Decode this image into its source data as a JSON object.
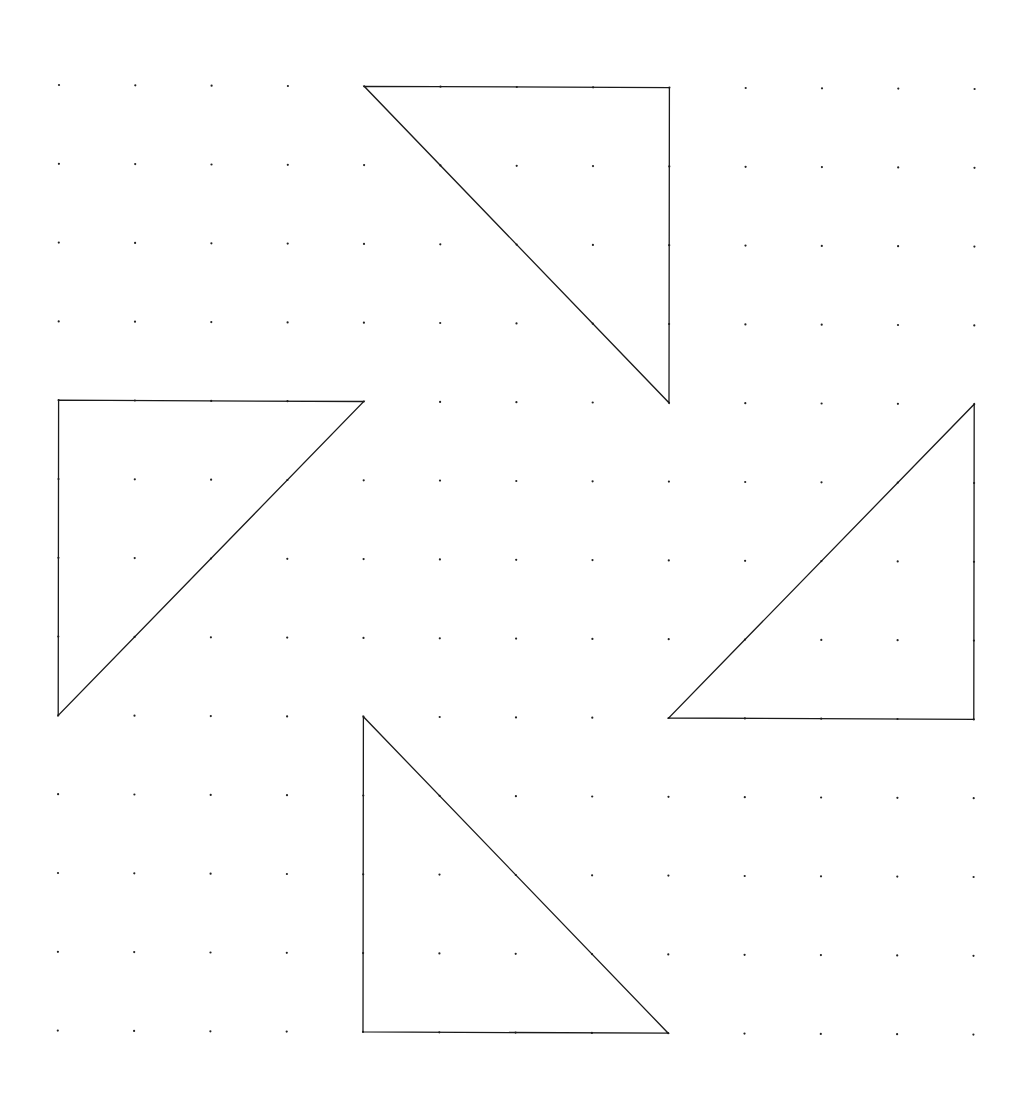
{
  "diagram": {
    "type": "dot-grid-with-triangles",
    "grid": {
      "rows": 13,
      "cols": 13,
      "origin": [
        59,
        85
      ],
      "col_step": [
        76.3,
        0.33
      ],
      "row_step": [
        -0.1,
        78.8
      ],
      "dot_radius": 1.1,
      "dot_color": "#222222"
    },
    "stroke_color": "#1a1a1a",
    "triangles": [
      {
        "name": "top-triangle",
        "vertices_grid": [
          [
            0,
            4
          ],
          [
            0,
            8
          ],
          [
            4,
            8
          ]
        ]
      },
      {
        "name": "left-triangle",
        "vertices_grid": [
          [
            4,
            0
          ],
          [
            4,
            4
          ],
          [
            8,
            0
          ]
        ]
      },
      {
        "name": "right-triangle",
        "vertices_grid": [
          [
            4,
            12
          ],
          [
            8,
            12
          ],
          [
            8,
            8
          ]
        ]
      },
      {
        "name": "bottom-triangle",
        "vertices_grid": [
          [
            8,
            4
          ],
          [
            12,
            4
          ],
          [
            12,
            8
          ]
        ]
      }
    ]
  }
}
